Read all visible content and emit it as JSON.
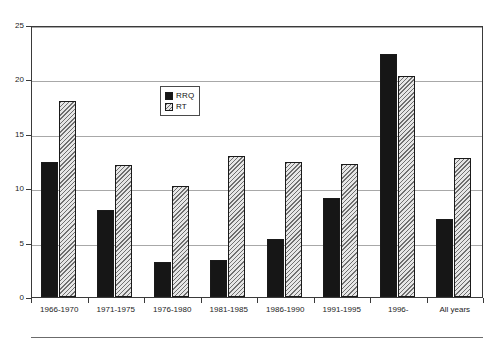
{
  "chart_data": {
    "type": "bar",
    "title": "",
    "subtitle": "",
    "xlabel": "",
    "ylabel": "",
    "ylim": [
      0,
      25
    ],
    "yticks": [
      "0",
      "5",
      "10",
      "15",
      "20",
      "25"
    ],
    "ytick_values": [
      0,
      5,
      10,
      15,
      20,
      25
    ],
    "grid": true,
    "legend_position": "inside-upper-left",
    "categories": [
      "1966-1970",
      "1971-1975",
      "1976-1980",
      "1981-1985",
      "1986-1990",
      "1991-1995",
      "1996-",
      "All years"
    ],
    "series": [
      {
        "name": "RRQ",
        "fill": "solid-black",
        "color": "#161616",
        "values": [
          12.4,
          8.0,
          3.2,
          3.4,
          5.3,
          9.1,
          22.3,
          7.2
        ]
      },
      {
        "name": "RT",
        "fill": "diagonal-hatch",
        "color": "#d2d2d2",
        "values": [
          18.0,
          12.1,
          10.2,
          13.0,
          12.4,
          12.2,
          20.3,
          12.8
        ]
      }
    ]
  },
  "legend": {
    "entries": [
      {
        "label": "RRQ"
      },
      {
        "label": "RT"
      }
    ]
  },
  "colors": {
    "series_rrq": "#161616",
    "series_rt": "#d2d2d2",
    "gridline": "#a8a8a8",
    "axis": "#3a3a3a",
    "background": "#ffffff",
    "text": "#1c1c1c"
  }
}
